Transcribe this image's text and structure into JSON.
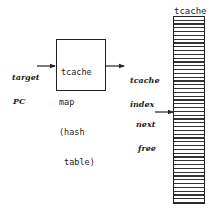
{
  "diagram": {
    "inputs": {
      "target_pc": {
        "line1": "target",
        "line2": "PC"
      }
    },
    "map_box": {
      "lines": [
        "tcache",
        "map",
        "(hash",
        " table)"
      ]
    },
    "outputs": {
      "tcache_index": {
        "line1": "tcache",
        "line2": "index"
      }
    },
    "tcache_array": {
      "title": "tcache",
      "pointer": {
        "line1": "next",
        "line2": "free"
      }
    },
    "arrows": [
      {
        "from": "target-pc-label",
        "to": "tcache-map-box"
      },
      {
        "from": "tcache-map-box",
        "to": "tcache-index-label"
      },
      {
        "from": "next-free-label",
        "to": "tcache-array"
      }
    ],
    "colors": {
      "ink": "#222222",
      "background": "#ffffff"
    }
  }
}
